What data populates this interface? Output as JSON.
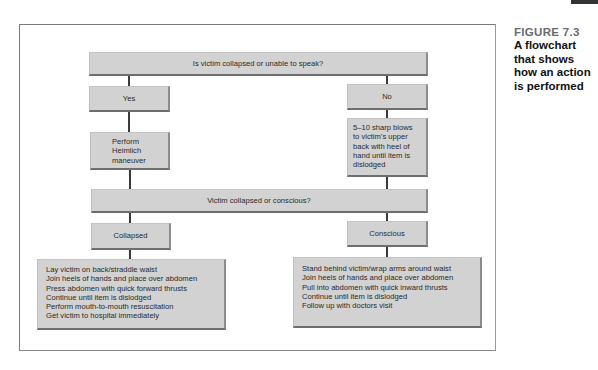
{
  "caption": {
    "figure_label": "FIGURE 7.3",
    "description_lines": [
      "A flowchart",
      "that shows",
      "how an action",
      "is performed"
    ]
  },
  "flowchart": {
    "question_1": "Is victim collapsed or unable to speak?",
    "yes_label": "Yes",
    "no_label": "No",
    "yes_action_lines": [
      "Perform",
      "Heimlich",
      "maneuver"
    ],
    "no_action_lines": [
      "5–10 sharp blows",
      "to victim’s upper",
      "back with heel of",
      "hand until item is",
      "dislodged"
    ],
    "question_2": "Victim collapsed or conscious?",
    "collapsed_label": "Collapsed",
    "conscious_label": "Conscious",
    "collapsed_steps": [
      "Lay victim on back/straddle waist",
      "Join heels of hands and place over abdomen",
      "Press abdomen with quick forward thrusts",
      "Continue until item is dislodged",
      "Perform mouth-to-mouth resuscitation",
      "Get victim to hospital immediately"
    ],
    "conscious_steps": [
      "Stand behind victim/wrap arms around waist",
      "Join heels of hands and place over abdomen",
      "Pull into abdomen with quick inward thrusts",
      "Continue until item is dislodged",
      "Follow up with doctors visit"
    ]
  },
  "colors": {
    "box_fill": "#d2d2d2",
    "connector": "#3a3a3a",
    "figure_label": "#6a6a6a"
  }
}
